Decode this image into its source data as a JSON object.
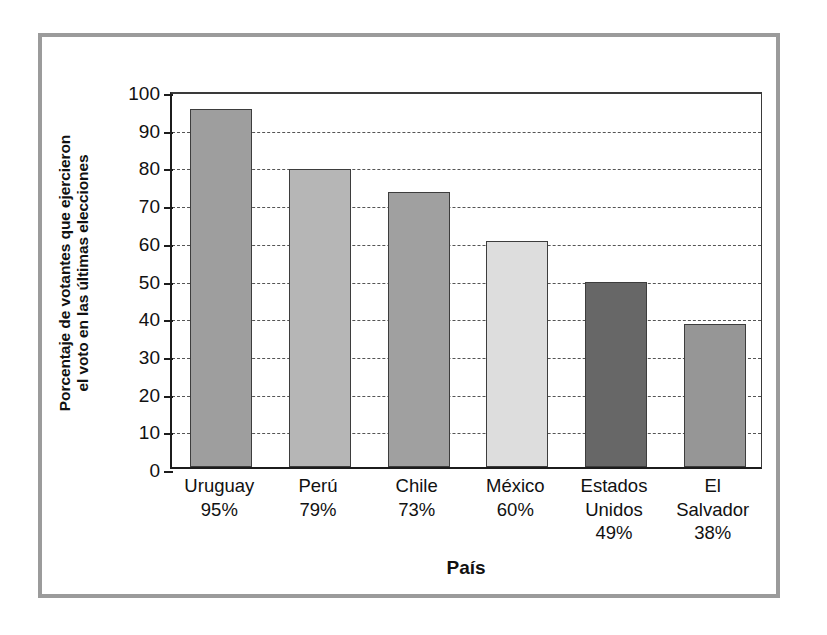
{
  "chart_data": {
    "type": "bar",
    "title": "",
    "xlabel": "País",
    "ylabel": "Porcentaje de votantes que ejercieron el voto en las últimas elecciones",
    "ylabel_line1": "Porcentaje de votantes que ejercieron",
    "ylabel_line2": "el voto en las últimas elecciones",
    "categories": [
      "Uruguay",
      "Perú",
      "Chile",
      "México",
      "Estados Unidos",
      "El Salvador"
    ],
    "values": [
      95,
      79,
      73,
      60,
      49,
      38
    ],
    "value_labels": [
      "95%",
      "79%",
      "73%",
      "60%",
      "49%",
      "38%"
    ],
    "category_lines": [
      [
        "Uruguay"
      ],
      [
        "Perú"
      ],
      [
        "Chile"
      ],
      [
        "México"
      ],
      [
        "Estados",
        "Unidos"
      ],
      [
        "El",
        "Salvador"
      ]
    ],
    "bar_colors": [
      "#9e9e9e",
      "#b6b6b6",
      "#a0a0a0",
      "#dddddd",
      "#676767",
      "#969696"
    ],
    "ylim": [
      0,
      100
    ],
    "ytick_step": 10,
    "ytick_labels": [
      "100",
      "90",
      "80",
      "70",
      "60",
      "50",
      "40",
      "30",
      "20",
      "10",
      "0"
    ],
    "ytick_values": [
      100,
      90,
      80,
      70,
      60,
      50,
      40,
      30,
      20,
      10,
      0
    ],
    "grid": true,
    "grid_style": "dashed-horizontal",
    "legend": "none",
    "axis_color": "#1c1c1c",
    "frame_color": "#9b9b9b",
    "background": "#ffffff"
  }
}
